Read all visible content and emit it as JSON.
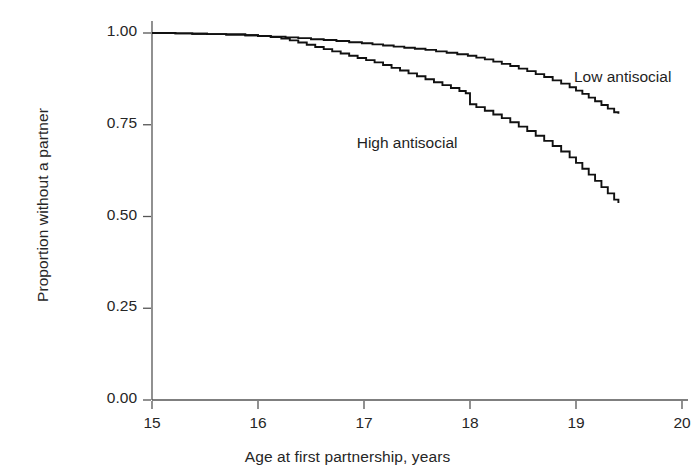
{
  "chart_data": {
    "type": "line",
    "title": "",
    "subtitle": "",
    "xlabel": "Age at first partnership, years",
    "ylabel": "Proportion without a partner",
    "xlim": [
      15,
      20
    ],
    "ylim": [
      0.0,
      1.0
    ],
    "xticks": [
      "15",
      "16",
      "17",
      "18",
      "19",
      "20"
    ],
    "xtick_values": [
      15,
      16,
      17,
      18,
      19,
      20
    ],
    "yticks": [
      "0.00",
      "0.25",
      "0.50",
      "0.75",
      "1.00"
    ],
    "ytick_values": [
      0.0,
      0.25,
      0.5,
      0.75,
      1.0
    ],
    "grid": false,
    "legend_position": "inline-annotations",
    "line_color": "#111111",
    "axis_color": "#555555",
    "annotations": [
      {
        "text": "Low antisocial",
        "x": 19.0,
        "y": 0.875
      },
      {
        "text": "High antisocial",
        "x": 16.95,
        "y": 0.695
      }
    ],
    "series": [
      {
        "name": "Low antisocial",
        "label": "Low antisocial",
        "color": "#111111",
        "step": true,
        "x": [
          15.0,
          15.22,
          15.38,
          15.52,
          15.7,
          15.88,
          16.0,
          16.12,
          16.26,
          16.38,
          16.5,
          16.62,
          16.74,
          16.86,
          16.98,
          17.08,
          17.18,
          17.28,
          17.38,
          17.48,
          17.58,
          17.68,
          17.78,
          17.88,
          17.98,
          18.06,
          18.14,
          18.22,
          18.3,
          18.38,
          18.46,
          18.54,
          18.62,
          18.7,
          18.78,
          18.86,
          18.94,
          19.0,
          19.06,
          19.12,
          19.18,
          19.24,
          19.3,
          19.36,
          19.4
        ],
        "y": [
          1.0,
          0.999,
          0.998,
          0.997,
          0.996,
          0.994,
          0.992,
          0.99,
          0.988,
          0.986,
          0.983,
          0.981,
          0.978,
          0.975,
          0.972,
          0.969,
          0.966,
          0.963,
          0.96,
          0.957,
          0.954,
          0.95,
          0.946,
          0.942,
          0.938,
          0.933,
          0.928,
          0.922,
          0.916,
          0.91,
          0.903,
          0.896,
          0.888,
          0.88,
          0.871,
          0.862,
          0.852,
          0.843,
          0.834,
          0.824,
          0.814,
          0.804,
          0.794,
          0.784,
          0.78
        ]
      },
      {
        "name": "High antisocial",
        "label": "High antisocial",
        "color": "#111111",
        "step": true,
        "x": [
          15.0,
          15.22,
          15.38,
          15.52,
          15.7,
          15.88,
          16.0,
          16.12,
          16.22,
          16.3,
          16.38,
          16.46,
          16.54,
          16.62,
          16.7,
          16.78,
          16.86,
          16.94,
          17.02,
          17.1,
          17.18,
          17.26,
          17.34,
          17.42,
          17.5,
          17.58,
          17.66,
          17.74,
          17.82,
          17.9,
          17.96,
          18.0,
          18.06,
          18.14,
          18.22,
          18.3,
          18.38,
          18.46,
          18.54,
          18.62,
          18.7,
          18.78,
          18.86,
          18.94,
          19.0,
          19.06,
          19.12,
          19.18,
          19.24,
          19.3,
          19.36,
          19.4
        ],
        "y": [
          1.0,
          0.999,
          0.998,
          0.997,
          0.996,
          0.994,
          0.992,
          0.989,
          0.985,
          0.98,
          0.974,
          0.968,
          0.962,
          0.956,
          0.95,
          0.944,
          0.938,
          0.932,
          0.926,
          0.92,
          0.913,
          0.905,
          0.898,
          0.89,
          0.882,
          0.874,
          0.866,
          0.858,
          0.85,
          0.842,
          0.836,
          0.806,
          0.798,
          0.788,
          0.778,
          0.768,
          0.757,
          0.745,
          0.733,
          0.72,
          0.706,
          0.692,
          0.677,
          0.661,
          0.646,
          0.63,
          0.614,
          0.597,
          0.58,
          0.563,
          0.546,
          0.537
        ]
      }
    ]
  }
}
